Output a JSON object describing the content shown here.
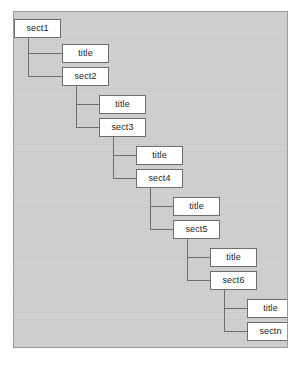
{
  "diagram": {
    "kind": "recursive-section-tree",
    "colors": {
      "page_background": "#ffffff",
      "panel_background": "#cdcdcd",
      "panel_border": "#9a9a9a",
      "node_fill": "#ffffff",
      "node_border": "#6e6e6e",
      "connector": "#6e6e6e",
      "node_text": "#1c1c1c"
    },
    "panel": {
      "x": 13,
      "y": 11,
      "width": 275,
      "height": 337
    },
    "node_size": {
      "width": 47,
      "height": 19
    },
    "nodes": [
      {
        "id": "sect1",
        "label": "sect1",
        "x": 13,
        "y": 18,
        "level": 0
      },
      {
        "id": "title1",
        "label": "title",
        "x": 61,
        "y": 43,
        "level": 1
      },
      {
        "id": "sect2",
        "label": "sect2",
        "x": 61,
        "y": 66,
        "level": 1
      },
      {
        "id": "title2",
        "label": "title",
        "x": 98,
        "y": 94,
        "level": 2
      },
      {
        "id": "sect3",
        "label": "sect3",
        "x": 98,
        "y": 117,
        "level": 2
      },
      {
        "id": "title3",
        "label": "title",
        "x": 135,
        "y": 145,
        "level": 3
      },
      {
        "id": "sect4",
        "label": "sect4",
        "x": 135,
        "y": 168,
        "level": 3
      },
      {
        "id": "title4",
        "label": "title",
        "x": 172,
        "y": 196,
        "level": 4
      },
      {
        "id": "sect5",
        "label": "sect5",
        "x": 172,
        "y": 219,
        "level": 4
      },
      {
        "id": "title5",
        "label": "title",
        "x": 209,
        "y": 247,
        "level": 5
      },
      {
        "id": "sect6",
        "label": "sect6",
        "x": 209,
        "y": 270,
        "level": 5
      },
      {
        "id": "title6",
        "label": "title",
        "x": 246,
        "y": 298,
        "level": 6
      },
      {
        "id": "sectn",
        "label": "sectn",
        "x": 246,
        "y": 321,
        "level": 6
      }
    ],
    "edges": [
      {
        "from": "sect1",
        "to": "title1",
        "stem_x": 27,
        "start_y": 37,
        "end_y": 53
      },
      {
        "from": "sect1",
        "to": "sect2",
        "stem_x": 27,
        "start_y": 37,
        "end_y": 76
      },
      {
        "from": "sect2",
        "to": "title2",
        "stem_x": 75,
        "start_y": 85,
        "end_y": 104
      },
      {
        "from": "sect2",
        "to": "sect3",
        "stem_x": 75,
        "start_y": 85,
        "end_y": 127
      },
      {
        "from": "sect3",
        "to": "title3",
        "stem_x": 112,
        "start_y": 136,
        "end_y": 155
      },
      {
        "from": "sect3",
        "to": "sect4",
        "stem_x": 112,
        "start_y": 136,
        "end_y": 178
      },
      {
        "from": "sect4",
        "to": "title4",
        "stem_x": 149,
        "start_y": 187,
        "end_y": 206
      },
      {
        "from": "sect4",
        "to": "sect5",
        "stem_x": 149,
        "start_y": 187,
        "end_y": 229
      },
      {
        "from": "sect5",
        "to": "title5",
        "stem_x": 186,
        "start_y": 238,
        "end_y": 257
      },
      {
        "from": "sect5",
        "to": "sect6",
        "stem_x": 186,
        "start_y": 238,
        "end_y": 280
      },
      {
        "from": "sect6",
        "to": "title6",
        "stem_x": 223,
        "start_y": 289,
        "end_y": 308
      },
      {
        "from": "sect6",
        "to": "sectn",
        "stem_x": 223,
        "start_y": 289,
        "end_y": 331
      }
    ]
  }
}
